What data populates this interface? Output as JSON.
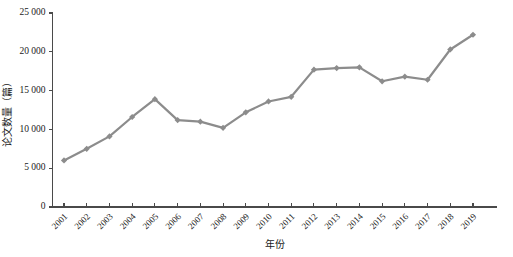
{
  "chart_data": {
    "type": "line",
    "title": "",
    "xlabel": "年份",
    "ylabel": "论文数量（篇）",
    "categories": [
      "2001",
      "2002",
      "2003",
      "2004",
      "2005",
      "2006",
      "2007",
      "2008",
      "2009",
      "2010",
      "2011",
      "2012",
      "2013",
      "2014",
      "2015",
      "2016",
      "2017",
      "2018",
      "2019"
    ],
    "series": [
      {
        "name": "论文数量",
        "values": [
          6000,
          7500,
          9100,
          11600,
          13900,
          11200,
          11000,
          10200,
          12200,
          13600,
          14200,
          17700,
          17900,
          18000,
          16200,
          16800,
          16400,
          20300,
          22200
        ]
      }
    ],
    "ylim": [
      0,
      25000
    ],
    "yticks": [
      0,
      5000,
      10000,
      15000,
      20000,
      25000
    ],
    "ytick_labels": [
      "0",
      "5 000",
      "10 000",
      "15 000",
      "20 000",
      "25 000"
    ],
    "grid": false,
    "legend": "none",
    "series_color": "#8c8c8c",
    "axis_color": "#4a4a4a",
    "text_color": "#1a1a1a",
    "marker": "diamond",
    "xtick_rotation": -45
  }
}
